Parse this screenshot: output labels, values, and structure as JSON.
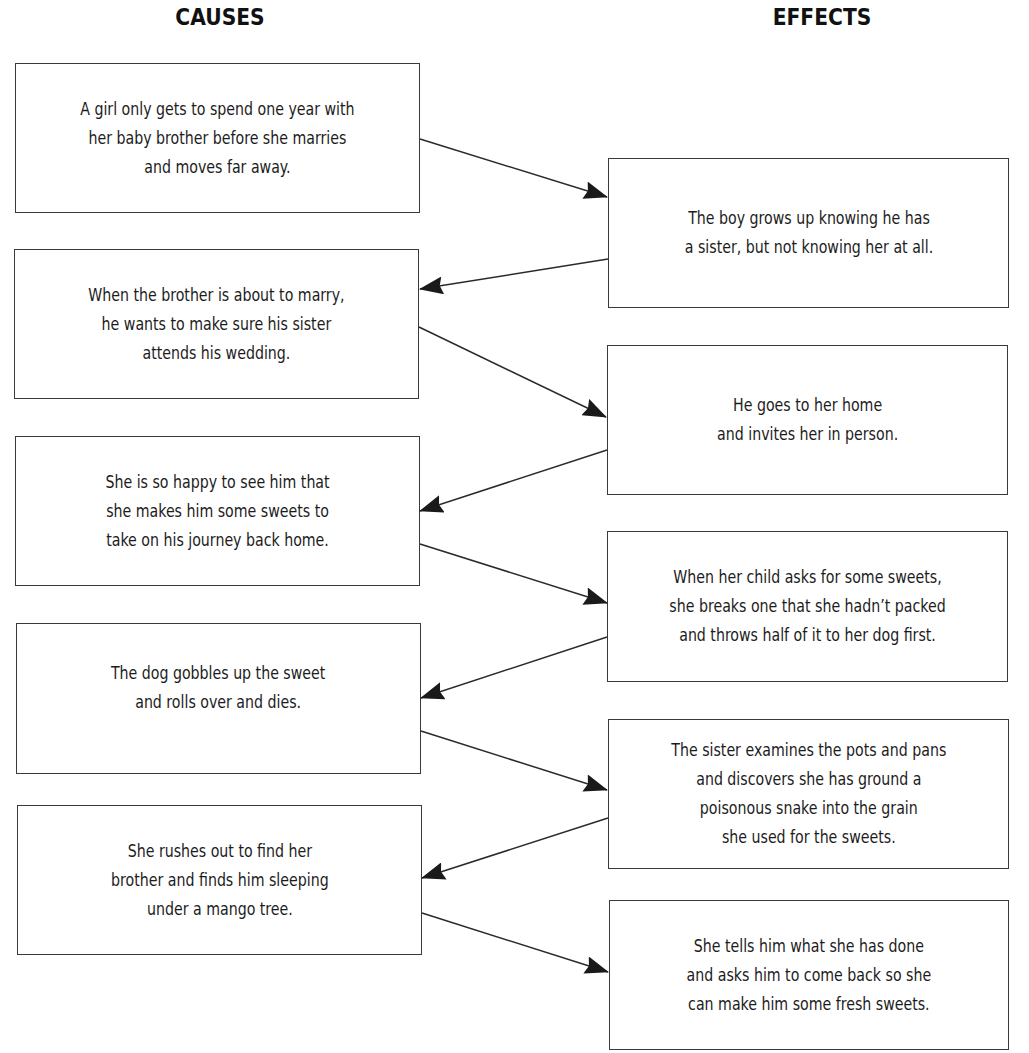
{
  "headings": {
    "causes": "CAUSES",
    "effects": "EFFECTS"
  },
  "causes": [
    {
      "text": "A girl only gets to spend one year with\nher baby brother before she marries\nand moves far away."
    },
    {
      "text": "When the brother is about to marry,\nhe wants to make sure his sister\nattends his wedding."
    },
    {
      "text": "She is so happy to see him that\nshe makes him some sweets to\ntake on his journey back home."
    },
    {
      "text": "The dog gobbles up the sweet\nand rolls over and dies."
    },
    {
      "text": "She rushes out to find her\nbrother and finds him sleeping\nunder a mango tree."
    }
  ],
  "effects": [
    {
      "text": "The boy grows up knowing he has\na sister, but not knowing her at all."
    },
    {
      "text": "He goes to her home\nand invites her in person."
    },
    {
      "text": "When her child asks for some sweets,\nshe breaks one that she hadn’t packed\nand throws half of it to her dog first."
    },
    {
      "text": "The sister examines the pots and pans\nand discovers she has ground a\npoisonous snake into the grain\nshe used for the sweets."
    },
    {
      "text": "She tells him what she has done\nand asks him to come back so she\ncan make him some fresh sweets."
    }
  ],
  "colors": {
    "border": "#3a3a3a",
    "arrow": "#1a1a1a",
    "text": "#1c1c1c"
  }
}
